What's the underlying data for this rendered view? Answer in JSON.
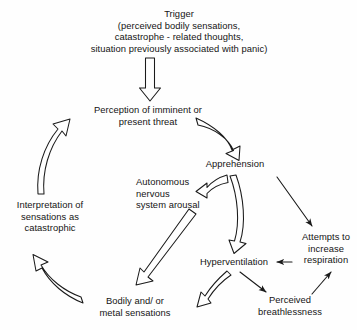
{
  "diagram": {
    "background_color": "#fefefe",
    "stroke_color": "#1a1a1a",
    "nodes": {
      "trigger": "Trigger\n(perceived bodily sensations,\ncatastrophe - related thoughts,\nsituation previously associated with panic)",
      "perception": "Perception of imminent or\npresent threat",
      "apprehension": "Apprehension",
      "autonomous": "Autonomous\nnervous\nsystem arousal",
      "interpretation": "Interpretation of\nsensations as\ncatastrophic",
      "attempts": "Attempts to\nincrease\nrespiration",
      "hyperventilation": "Hyperventilation",
      "bodily": "Bodily and/ or\nmetal sensations",
      "breathlessness": "Perceived\nbreathlessness"
    },
    "edges": [
      {
        "id": "trigger-to-perception",
        "from": "trigger",
        "to": "perception",
        "style": "open-block",
        "shape": "straight-down"
      },
      {
        "id": "perception-to-apprehension",
        "from": "perception",
        "to": "apprehension",
        "style": "open-block",
        "shape": "curve-right-down"
      },
      {
        "id": "apprehension-to-autonomous",
        "from": "apprehension",
        "to": "autonomous",
        "style": "open-block",
        "shape": "hook-left-down"
      },
      {
        "id": "apprehension-to-hyperv",
        "from": "apprehension",
        "to": "hyperventilation",
        "style": "open-block",
        "shape": "curve-down"
      },
      {
        "id": "apprehension-to-attempts",
        "from": "apprehension",
        "to": "attempts",
        "style": "thin-line",
        "shape": "diagonal-down-right"
      },
      {
        "id": "autonomous-to-bodily",
        "from": "autonomous",
        "to": "bodily",
        "style": "open-block",
        "shape": "diagonal-down-left"
      },
      {
        "id": "hyperv-to-bodily",
        "from": "hyperventilation",
        "to": "bodily",
        "style": "open-block",
        "shape": "curve-down-left"
      },
      {
        "id": "hyperv-to-breathlessness",
        "from": "hyperventilation",
        "to": "breathlessness",
        "style": "thin-line",
        "shape": "diagonal-down-right"
      },
      {
        "id": "breathlessness-to-attempts",
        "from": "breathlessness",
        "to": "attempts",
        "style": "thin-line",
        "shape": "diagonal-up-right"
      },
      {
        "id": "attempts-to-hyperv",
        "from": "attempts",
        "to": "hyperventilation",
        "style": "thin-line",
        "shape": "straight-left"
      },
      {
        "id": "bodily-to-interpretation",
        "from": "bodily",
        "to": "interpretation",
        "style": "open-block",
        "shape": "curve-up-left"
      },
      {
        "id": "interpretation-to-perception",
        "from": "interpretation",
        "to": "perception",
        "style": "open-block",
        "shape": "curve-up-right"
      }
    ]
  }
}
